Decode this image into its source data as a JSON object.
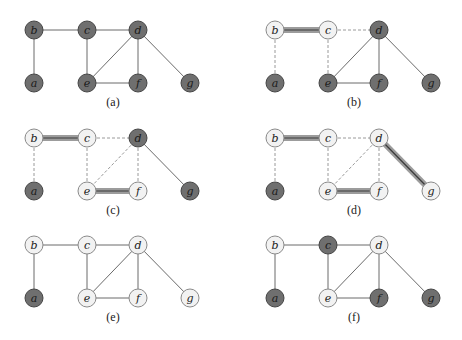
{
  "figure": {
    "colors": {
      "dark_fill": "#6f6f6f",
      "dark_stroke": "#454545",
      "light_fill": "#f2f2f2",
      "light_stroke": "#8a8a8a",
      "solid_edge": "#6a6a6a",
      "dashed_edge": "#9a9a9a",
      "matched_outer": "#9c9c9c",
      "matched_inner": "#3a3a3a"
    },
    "node_positions": {
      "a": [
        34,
        53
      ],
      "b": [
        34,
        0
      ],
      "c": [
        87,
        0
      ],
      "d": [
        138,
        0
      ],
      "e": [
        87,
        53
      ],
      "f": [
        138,
        53
      ],
      "g": [
        190,
        53
      ]
    },
    "edges": [
      [
        "b",
        "c"
      ],
      [
        "c",
        "d"
      ],
      [
        "b",
        "a"
      ],
      [
        "c",
        "e"
      ],
      [
        "d",
        "e"
      ],
      [
        "d",
        "f"
      ],
      [
        "d",
        "g"
      ],
      [
        "e",
        "f"
      ]
    ],
    "panels": [
      {
        "caption": "(a)",
        "origin": [
          0,
          30
        ],
        "caption_pos": [
          113,
          106
        ],
        "dark_nodes": [
          "a",
          "b",
          "c",
          "d",
          "e",
          "f",
          "g"
        ],
        "matched_edges": [],
        "dashed_edges": []
      },
      {
        "caption": "(b)",
        "origin": [
          241,
          30
        ],
        "caption_pos": [
          354,
          106
        ],
        "dark_nodes": [
          "a",
          "d",
          "e",
          "f",
          "g"
        ],
        "matched_edges": [
          [
            "b",
            "c"
          ]
        ],
        "dashed_edges": [
          [
            "c",
            "d"
          ],
          [
            "b",
            "a"
          ],
          [
            "c",
            "e"
          ]
        ]
      },
      {
        "caption": "(c)",
        "origin": [
          0,
          138
        ],
        "caption_pos": [
          113,
          214
        ],
        "dark_nodes": [
          "a",
          "d",
          "g"
        ],
        "matched_edges": [
          [
            "b",
            "c"
          ],
          [
            "e",
            "f"
          ]
        ],
        "dashed_edges": [
          [
            "c",
            "d"
          ],
          [
            "b",
            "a"
          ],
          [
            "c",
            "e"
          ],
          [
            "d",
            "e"
          ],
          [
            "d",
            "f"
          ]
        ]
      },
      {
        "caption": "(d)",
        "origin": [
          241,
          138
        ],
        "caption_pos": [
          354,
          214
        ],
        "dark_nodes": [
          "a"
        ],
        "matched_edges": [
          [
            "b",
            "c"
          ],
          [
            "e",
            "f"
          ],
          [
            "d",
            "g"
          ]
        ],
        "dashed_edges": [
          [
            "c",
            "d"
          ],
          [
            "b",
            "a"
          ],
          [
            "c",
            "e"
          ],
          [
            "d",
            "e"
          ],
          [
            "d",
            "f"
          ]
        ]
      },
      {
        "caption": "(e)",
        "origin": [
          0,
          245
        ],
        "caption_pos": [
          113,
          321
        ],
        "dark_nodes": [
          "a"
        ],
        "matched_edges": [],
        "dashed_edges": []
      },
      {
        "caption": "(f)",
        "origin": [
          241,
          245
        ],
        "caption_pos": [
          354,
          321
        ],
        "dark_nodes": [
          "a",
          "c",
          "f",
          "g"
        ],
        "matched_edges": [],
        "dashed_edges": []
      }
    ]
  }
}
